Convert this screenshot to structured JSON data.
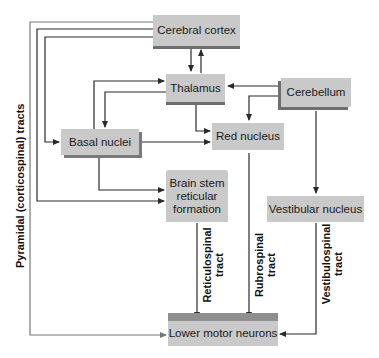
{
  "diagram": {
    "nodes": {
      "cerebral_cortex": "Cerebral cortex",
      "thalamus": "Thalamus",
      "cerebellum": "Cerebellum",
      "basal_nuclei": "Basal nuclei",
      "red_nucleus": "Red nucleus",
      "brain_stem_line1": "Brain stem",
      "brain_stem_line2": "reticular",
      "brain_stem_line3": "formation",
      "vestibular_nucleus": "Vestibular nucleus",
      "lower_motor_neurons": "Lower motor neurons"
    },
    "tract_labels": {
      "pyramidal": "Pyramidal (corticospinal) tracts",
      "reticulospinal_1": "Reticulospinal",
      "reticulospinal_2": "tract",
      "rubrospinal_1": "Rubrospinal",
      "rubrospinal_2": "tract",
      "vestibulospinal_1": "Vestibulospinal",
      "vestibulospinal_2": "tract"
    },
    "colors": {
      "box_fill": "#c9c9c9",
      "box_shadow": "#6e6e6e",
      "arrow": "#2a2a2a"
    }
  }
}
